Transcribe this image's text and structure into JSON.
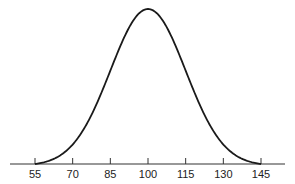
{
  "chart_data": {
    "type": "line",
    "title": "",
    "xlabel": "",
    "ylabel": "",
    "mean": 100,
    "sd": 15,
    "x_ticks": [
      55,
      70,
      85,
      100,
      115,
      130,
      145
    ],
    "x_tick_labels": [
      "55",
      "70",
      "85",
      "100",
      "115",
      "130",
      "145"
    ],
    "xlim": [
      55,
      145
    ],
    "grid": false,
    "legend": null,
    "series": [
      {
        "name": "normal curve",
        "x": [
          55,
          62.5,
          70,
          77.5,
          85,
          92.5,
          100,
          107.5,
          115,
          122.5,
          130,
          137.5,
          145
        ],
        "y": [
          0.004,
          0.018,
          0.054,
          0.13,
          0.242,
          0.352,
          0.399,
          0.352,
          0.242,
          0.13,
          0.054,
          0.018,
          0.004
        ]
      }
    ],
    "colors": {
      "curve": "#1a1a1a",
      "axis": "#333333"
    }
  }
}
